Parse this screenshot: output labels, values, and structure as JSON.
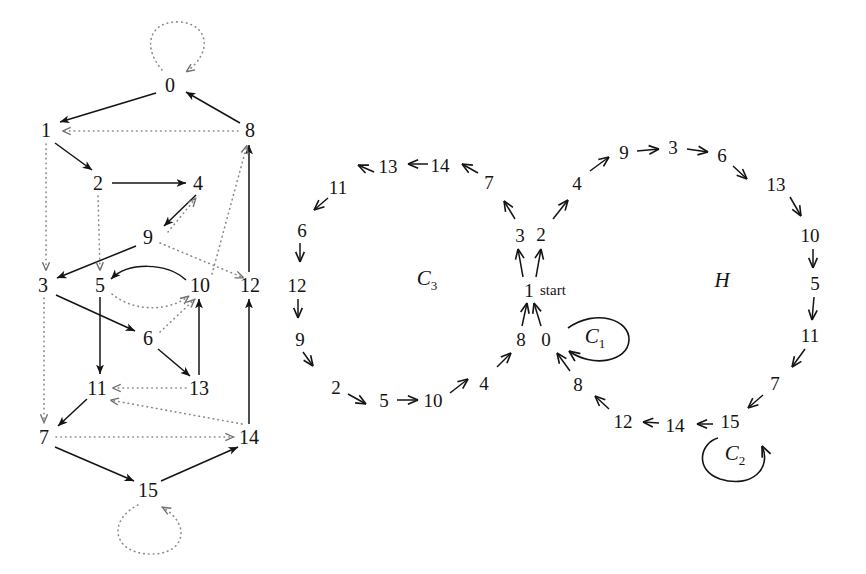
{
  "figure": {
    "title": "",
    "panels": [
      {
        "name": "left-graph",
        "kind": "directed-graph",
        "nodes": [
          {
            "id": "0",
            "label": "0",
            "x": 170,
            "y": 85
          },
          {
            "id": "1",
            "label": "1",
            "x": 46,
            "y": 130
          },
          {
            "id": "8",
            "label": "8",
            "x": 250,
            "y": 130
          },
          {
            "id": "2",
            "label": "2",
            "x": 98,
            "y": 183
          },
          {
            "id": "4",
            "label": "4",
            "x": 198,
            "y": 183
          },
          {
            "id": "9",
            "label": "9",
            "x": 148,
            "y": 237
          },
          {
            "id": "3",
            "label": "3",
            "x": 43,
            "y": 285
          },
          {
            "id": "5",
            "label": "5",
            "x": 100,
            "y": 285
          },
          {
            "id": "10",
            "label": "10",
            "x": 200,
            "y": 285
          },
          {
            "id": "12",
            "label": "12",
            "x": 250,
            "y": 285
          },
          {
            "id": "6",
            "label": "6",
            "x": 148,
            "y": 338
          },
          {
            "id": "11",
            "label": "11",
            "x": 97,
            "y": 388
          },
          {
            "id": "13",
            "label": "13",
            "x": 199,
            "y": 388
          },
          {
            "id": "7",
            "label": "7",
            "x": 44,
            "y": 437
          },
          {
            "id": "14",
            "label": "14",
            "x": 249,
            "y": 437
          },
          {
            "id": "15",
            "label": "15",
            "x": 148,
            "y": 490
          }
        ],
        "edges": [
          {
            "from": "0",
            "to": "0",
            "style": "dotted",
            "kind": "self-loop-top"
          },
          {
            "from": "0",
            "to": "1",
            "style": "solid"
          },
          {
            "from": "8",
            "to": "0",
            "style": "solid"
          },
          {
            "from": "8",
            "to": "1",
            "style": "dotted"
          },
          {
            "from": "1",
            "to": "2",
            "style": "solid"
          },
          {
            "from": "1",
            "to": "3",
            "style": "dotted"
          },
          {
            "from": "2",
            "to": "4",
            "style": "solid"
          },
          {
            "from": "2",
            "to": "5",
            "style": "dotted"
          },
          {
            "from": "4",
            "to": "9",
            "style": "solid"
          },
          {
            "from": "9",
            "to": "3",
            "style": "solid"
          },
          {
            "from": "9",
            "to": "4",
            "style": "dotted"
          },
          {
            "from": "10",
            "to": "5",
            "style": "solid"
          },
          {
            "from": "5",
            "to": "10",
            "style": "dotted"
          },
          {
            "from": "10",
            "to": "8",
            "style": "dotted"
          },
          {
            "from": "9",
            "to": "12",
            "style": "dotted"
          },
          {
            "from": "3",
            "to": "6",
            "style": "solid"
          },
          {
            "from": "5",
            "to": "11",
            "style": "solid"
          },
          {
            "from": "6",
            "to": "13",
            "style": "solid"
          },
          {
            "from": "6",
            "to": "10",
            "style": "dotted"
          },
          {
            "from": "13",
            "to": "11",
            "style": "dotted"
          },
          {
            "from": "13",
            "to": "10",
            "style": "solid"
          },
          {
            "from": "11",
            "to": "7",
            "style": "solid"
          },
          {
            "from": "3",
            "to": "7",
            "style": "dotted"
          },
          {
            "from": "7",
            "to": "14",
            "style": "dotted"
          },
          {
            "from": "7",
            "to": "15",
            "style": "solid"
          },
          {
            "from": "15",
            "to": "14",
            "style": "solid"
          },
          {
            "from": "14",
            "to": "12",
            "style": "solid"
          },
          {
            "from": "12",
            "to": "8",
            "style": "solid"
          },
          {
            "from": "14",
            "to": "11",
            "style": "dotted"
          },
          {
            "from": "15",
            "to": "15",
            "style": "dotted",
            "kind": "self-loop-bottom"
          }
        ]
      },
      {
        "name": "right-cycle-decomposition",
        "kind": "cycle-diagram",
        "cycle_labels": [
          {
            "id": "C3",
            "label": "C",
            "sub": "3",
            "x": 427,
            "y": 280
          },
          {
            "id": "H",
            "label": "H",
            "sub": "",
            "x": 722,
            "y": 282
          },
          {
            "id": "C1",
            "label": "C",
            "sub": "1",
            "x": 595,
            "y": 338
          },
          {
            "id": "C2",
            "label": "C",
            "sub": "2",
            "x": 735,
            "y": 455
          }
        ],
        "start_label": "start",
        "start_label_x": 540,
        "start_label_y": 290,
        "nodes": [
          {
            "id": "c3-13",
            "label": "13",
            "x": 388,
            "y": 166
          },
          {
            "id": "c3-14",
            "label": "14",
            "x": 440,
            "y": 165
          },
          {
            "id": "c3-7",
            "label": "7",
            "x": 489,
            "y": 182
          },
          {
            "id": "c3-11",
            "label": "11",
            "x": 338,
            "y": 187
          },
          {
            "id": "c3-6",
            "label": "6",
            "x": 302,
            "y": 230
          },
          {
            "id": "c3-12",
            "label": "12",
            "x": 297,
            "y": 285
          },
          {
            "id": "c3-9",
            "label": "9",
            "x": 300,
            "y": 339
          },
          {
            "id": "c3-2",
            "label": "2",
            "x": 336,
            "y": 387
          },
          {
            "id": "c3-5",
            "label": "5",
            "x": 384,
            "y": 400
          },
          {
            "id": "c3-10",
            "label": "10",
            "x": 433,
            "y": 400
          },
          {
            "id": "c3-4",
            "label": "4",
            "x": 484,
            "y": 383
          },
          {
            "id": "ctr-3",
            "label": "3",
            "x": 520,
            "y": 235
          },
          {
            "id": "ctr-2",
            "label": "2",
            "x": 541,
            "y": 234
          },
          {
            "id": "ctr-1",
            "label": "1",
            "x": 529,
            "y": 290
          },
          {
            "id": "ctr-8",
            "label": "8",
            "x": 521,
            "y": 339
          },
          {
            "id": "ctr-0",
            "label": "0",
            "x": 546,
            "y": 339
          },
          {
            "id": "h-4",
            "label": "4",
            "x": 577,
            "y": 183
          },
          {
            "id": "h-9",
            "label": "9",
            "x": 624,
            "y": 152
          },
          {
            "id": "h-3",
            "label": "3",
            "x": 673,
            "y": 147
          },
          {
            "id": "h-6",
            "label": "6",
            "x": 722,
            "y": 155
          },
          {
            "id": "h-13",
            "label": "13",
            "x": 776,
            "y": 184
          },
          {
            "id": "h-10",
            "label": "10",
            "x": 810,
            "y": 235
          },
          {
            "id": "h-5",
            "label": "5",
            "x": 815,
            "y": 283
          },
          {
            "id": "h-11",
            "label": "11",
            "x": 810,
            "y": 335
          },
          {
            "id": "h-7",
            "label": "7",
            "x": 775,
            "y": 383
          },
          {
            "id": "h-15",
            "label": "15",
            "x": 730,
            "y": 421
          },
          {
            "id": "h-14",
            "label": "14",
            "x": 675,
            "y": 425
          },
          {
            "id": "h-12",
            "label": "12",
            "x": 623,
            "y": 421
          },
          {
            "id": "h-8",
            "label": "8",
            "x": 578,
            "y": 384
          }
        ],
        "arrows": [
          {
            "from": "c3-14",
            "to": "c3-13"
          },
          {
            "from": "c3-7",
            "to": "c3-14"
          },
          {
            "from": "c3-13",
            "to": "c3-11"
          },
          {
            "from": "c3-11",
            "to": "c3-6"
          },
          {
            "from": "c3-6",
            "to": "c3-12"
          },
          {
            "from": "c3-12",
            "to": "c3-9"
          },
          {
            "from": "c3-9",
            "to": "c3-2"
          },
          {
            "from": "c3-2",
            "to": "c3-5"
          },
          {
            "from": "c3-5",
            "to": "c3-10"
          },
          {
            "from": "c3-10",
            "to": "c3-4"
          },
          {
            "from": "c3-4",
            "to": "ctr-8"
          },
          {
            "from": "ctr-3",
            "to": "c3-7"
          },
          {
            "from": "ctr-1",
            "to": "ctr-3"
          },
          {
            "from": "ctr-1",
            "to": "ctr-2"
          },
          {
            "from": "ctr-2",
            "to": "h-4"
          },
          {
            "from": "ctr-8",
            "to": "ctr-1"
          },
          {
            "from": "ctr-0",
            "to": "ctr-1"
          },
          {
            "from": "h-8",
            "to": "ctr-0"
          },
          {
            "from": "h-4",
            "to": "h-9"
          },
          {
            "from": "h-9",
            "to": "h-3"
          },
          {
            "from": "h-3",
            "to": "h-6"
          },
          {
            "from": "h-6",
            "to": "h-13"
          },
          {
            "from": "h-13",
            "to": "h-10"
          },
          {
            "from": "h-10",
            "to": "h-5"
          },
          {
            "from": "h-5",
            "to": "h-11"
          },
          {
            "from": "h-11",
            "to": "h-7"
          },
          {
            "from": "h-7",
            "to": "h-15"
          },
          {
            "from": "h-15",
            "to": "h-14"
          },
          {
            "from": "h-14",
            "to": "h-12"
          },
          {
            "from": "h-12",
            "to": "h-8"
          }
        ]
      }
    ]
  },
  "style": {
    "ink": "#141414",
    "dotted": "#8a8a8a",
    "background": "#ffffff"
  }
}
